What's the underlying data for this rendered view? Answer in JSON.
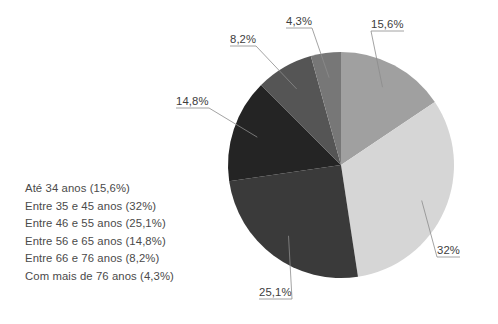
{
  "chart_data": {
    "type": "pie",
    "title": "",
    "categories": [
      "Até 34 anos",
      "Entre 35 e 45 anos",
      "Entre 46 e 55 anos",
      "Entre 56 e 65 anos",
      "Entre 66 e 76 anos",
      "Com mais de 76 anos"
    ],
    "values": [
      15.6,
      32.0,
      25.1,
      14.8,
      8.2,
      4.3
    ],
    "value_labels": [
      "15,6%",
      "32%",
      "25,1%",
      "14,8%",
      "8,2%",
      "4,3%"
    ],
    "colors": [
      "#a0a0a0",
      "#d6d6d6",
      "#3a3a3a",
      "#242424",
      "#555555",
      "#777777"
    ],
    "legend_position": "left",
    "start_angle_deg": 0,
    "direction": "clockwise",
    "grid": false,
    "xlabel": "",
    "ylabel": ""
  },
  "legend": {
    "items": [
      {
        "label": "Até 34 anos (15,6%)"
      },
      {
        "label": "Entre 35 e 45 anos (32%)"
      },
      {
        "label": "Entre 46 e 55 anos (25,1%)"
      },
      {
        "label": "Entre 56 e 65 anos (14,8%)"
      },
      {
        "label": "Entre 66 e 76 anos (8,2%)"
      },
      {
        "label": "Com mais de 76 anos (4,3%)"
      }
    ]
  },
  "callouts": [
    {
      "text": "15,6%",
      "x": 371,
      "y": 18
    },
    {
      "text": "32%",
      "x": 437,
      "y": 244
    },
    {
      "text": "25,1%",
      "x": 259,
      "y": 286
    },
    {
      "text": "14,8%",
      "x": 176,
      "y": 95
    },
    {
      "text": "8,2%",
      "x": 230,
      "y": 33
    },
    {
      "text": "4,3%",
      "x": 286,
      "y": 15
    }
  ],
  "style": {
    "leader_line_color": "#8c8c8c",
    "text_color": "#4a4a4a",
    "background": "#ffffff"
  }
}
